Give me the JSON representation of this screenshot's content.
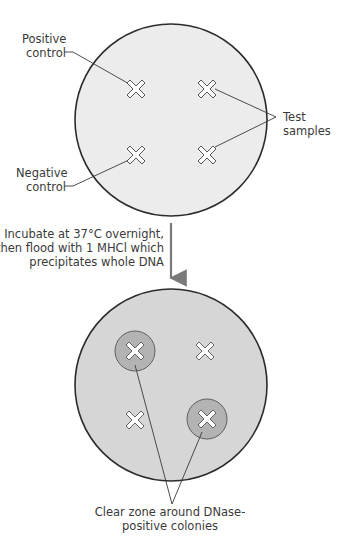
{
  "colors": {
    "plate_fill": "#ececec",
    "plate_fill_after": "#d6d6d6",
    "clear_zone": "#b3b3b3",
    "outline": "#2b2b2b",
    "arrow": "#7a7a7a",
    "text": "#3a3a3a"
  },
  "top_plate": {
    "labels": {
      "positive_control": [
        "Positive",
        "control"
      ],
      "negative_control": [
        "Negative",
        "control"
      ],
      "test_samples": [
        "Test",
        "samples"
      ]
    },
    "markers": [
      {
        "id": "positive-control",
        "x": 136,
        "y": 89
      },
      {
        "id": "test-sample-1",
        "x": 207,
        "y": 89
      },
      {
        "id": "negative-control",
        "x": 136,
        "y": 155
      },
      {
        "id": "test-sample-2",
        "x": 207,
        "y": 155
      }
    ]
  },
  "step": {
    "lines": [
      "Incubate at 37°C overnight,",
      "then flood with 1 MHCl which",
      "precipitates whole DNA"
    ]
  },
  "bottom_plate": {
    "markers": [
      {
        "id": "positive-with-zone",
        "x": 135,
        "y": 351,
        "clear_zone": true
      },
      {
        "id": "negative-1",
        "x": 205,
        "y": 351,
        "clear_zone": false
      },
      {
        "id": "negative-2",
        "x": 135,
        "y": 420,
        "clear_zone": false
      },
      {
        "id": "positive-with-zone-2",
        "x": 207,
        "y": 419,
        "clear_zone": true
      }
    ],
    "caption": [
      "Clear zone around DNase-",
      "positive colonies"
    ]
  }
}
